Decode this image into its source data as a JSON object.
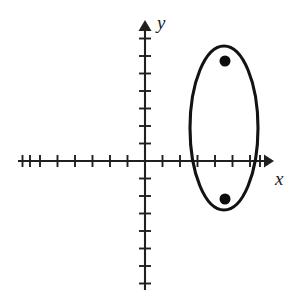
{
  "figure": {
    "width": 305,
    "height": 304,
    "background_color": "#ffffff",
    "curve_color": "#141212",
    "axis_color": "#221f1f",
    "point_color": "#0d0b0b"
  },
  "axes": {
    "x_label": "x",
    "y_label": "y",
    "origin_px": {
      "x": 145,
      "y": 161
    },
    "unit_px": 17.5,
    "x_axis": {
      "start_px": 18,
      "end_px": 272,
      "arrow_at": "right",
      "tick_count_negative": 8,
      "tick_count_positive": 7,
      "tick_half_length_px": 6,
      "tick_labels": [],
      "range_units": [
        -7.3,
        7.3
      ]
    },
    "y_axis": {
      "start_px": 290,
      "end_px": 22,
      "arrow_at": "top",
      "tick_count_positive": 7,
      "tick_count_negative": 7,
      "tick_half_length_px": 6,
      "tick_labels": [],
      "range_units": [
        -7.4,
        7.9
      ]
    },
    "grid": "off",
    "legend": "none"
  },
  "chart_data": {
    "type": "line",
    "title": "",
    "subtitle": "",
    "xlabel": "x",
    "ylabel": "y",
    "xlim": [
      -7.3,
      7.3
    ],
    "ylim": [
      -7.4,
      7.9
    ],
    "grid": false,
    "legend_position": "none",
    "series": [
      {
        "name": "ellipse",
        "shape": "ellipse",
        "center": [
          4.5,
          1.9
        ],
        "semi_axis_x": 2.0,
        "semi_axis_y": 4.7,
        "orientation": "vertical-major",
        "center_px": [
          224,
          128
        ],
        "semi_axis_x_px": 34,
        "semi_axis_y_px": 82,
        "vertices": [
          [
            4.5,
            6.6
          ],
          [
            4.5,
            -2.8
          ]
        ],
        "co_vertices": [
          [
            2.5,
            1.9
          ],
          [
            6.5,
            1.9
          ]
        ],
        "x_intercepts": [
          2.6,
          6.4
        ]
      },
      {
        "name": "foci",
        "shape": "points",
        "marker": "filled-circle",
        "marker_radius_px": 5.5,
        "points": [
          {
            "x": 4.5,
            "y": 5.7,
            "px": [
              225,
              61
            ]
          },
          {
            "x": 4.5,
            "y": -2.2,
            "px": [
              225,
              199
            ]
          }
        ]
      }
    ],
    "annotations": []
  }
}
